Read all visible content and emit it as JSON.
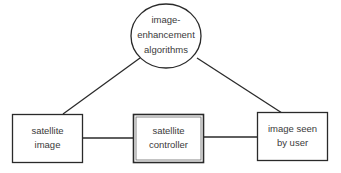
{
  "diagram": {
    "nodes": {
      "algorithms": {
        "lines": [
          "image-",
          "enhancement",
          "algorithms"
        ],
        "shape": "ellipse"
      },
      "satellite_image": {
        "lines": [
          "satellite",
          "image"
        ],
        "shape": "rectangle"
      },
      "controller": {
        "lines": [
          "satellite",
          "controller"
        ],
        "shape": "double-rectangle"
      },
      "image_seen": {
        "lines": [
          "image seen",
          "by user"
        ],
        "shape": "rectangle"
      }
    },
    "edges": [
      {
        "from": "algorithms",
        "to": "satellite_image"
      },
      {
        "from": "algorithms",
        "to": "image_seen"
      },
      {
        "from": "satellite_image",
        "to": "controller"
      },
      {
        "from": "controller",
        "to": "image_seen"
      }
    ],
    "colors": {
      "stroke": "#2a2a2a",
      "text": "#3a3a3a",
      "background": "#ffffff"
    }
  }
}
